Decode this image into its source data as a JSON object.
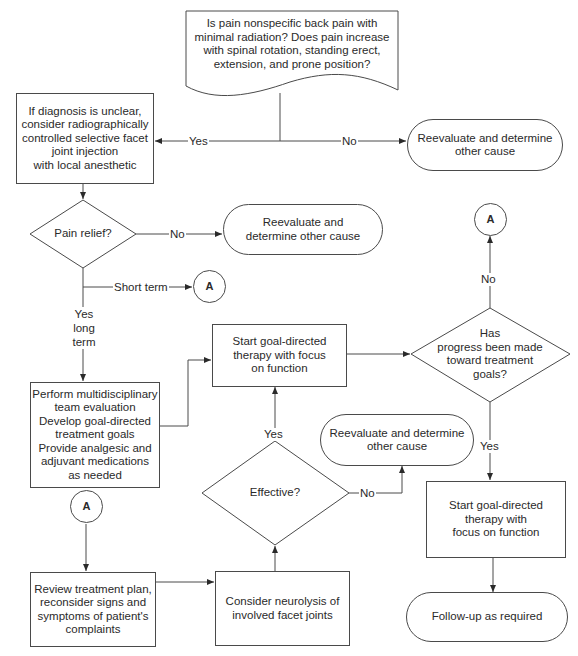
{
  "diagram": {
    "type": "flowchart",
    "nodes": {
      "start_question": "Is pain nonspecific back pain with minimal radiation? Does pain increase with spinal rotation, standing erect, extension, and prone position?",
      "facet_injection": "If diagnosis is unclear,\nconsider radiographically\ncontrolled selective facet\njoint injection\nwith local anesthetic",
      "reevaluate_1": "Reevaluate and determine\nother cause",
      "pain_relief": "Pain relief?",
      "reevaluate_2": "Reevaluate and\ndetermine other cause",
      "connector_a_short": "A",
      "multidisciplinary": "Perform multidisciplinary\nteam evaluation\nDevelop goal-directed\ntreatment goals\nProvide analgesic and\nadjuvant medications\nas needed",
      "goal_therapy_1": "Start goal-directed\ntherapy with focus\non function",
      "progress_question": "Has\nprogress been made\ntoward treatment\ngoals?",
      "connector_a_top": "A",
      "reevaluate_3": "Reevaluate and determine\nother cause",
      "effective": "Effective?",
      "goal_therapy_2": "Start goal-directed\ntherapy with\nfocus on function",
      "connector_a_bottom": "A",
      "review_plan": "Review treatment plan,\nreconsider signs and\nsymptoms of patient's\ncomplaints",
      "neurolysis": "Consider neurolysis of\ninvolved facet joints",
      "follow_up": "Follow-up as required"
    },
    "edge_labels": {
      "start_yes": "Yes",
      "start_no": "No",
      "relief_no": "No",
      "relief_short": "Short term",
      "relief_yes_long": "Yes\nlong term",
      "progress_no": "No",
      "progress_yes": "Yes",
      "effective_yes": "Yes",
      "effective_no": "No"
    },
    "colors": {
      "line": "#4a4a4a",
      "text": "#2a2a2a",
      "background": "#ffffff"
    }
  }
}
